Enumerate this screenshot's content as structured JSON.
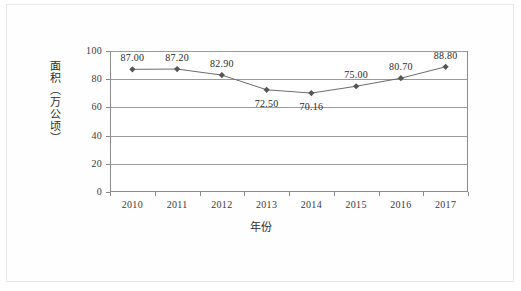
{
  "chart_data": {
    "type": "line",
    "title": "",
    "subtitle": "",
    "xlabel": "年份",
    "ylabel": "面积（万公顷）",
    "categories": [
      "2010",
      "2011",
      "2012",
      "2013",
      "2014",
      "2015",
      "2016",
      "2017"
    ],
    "values": [
      87.0,
      87.2,
      82.9,
      72.5,
      70.16,
      75.0,
      80.7,
      88.8
    ],
    "data_labels": [
      "87.00",
      "87.20",
      "82.90",
      "72.50",
      "70.16",
      "75.00",
      "80.70",
      "88.80"
    ],
    "label_positions": [
      "above",
      "above",
      "above",
      "below",
      "below",
      "above",
      "above",
      "above"
    ],
    "ylim": [
      0,
      100
    ],
    "y_ticks": [
      "0",
      "20",
      "40",
      "60",
      "80",
      "100"
    ],
    "y_tick_values": [
      0,
      20,
      40,
      60,
      80,
      100
    ],
    "grid": true,
    "grid_axis": "y",
    "legend": "none",
    "series": [
      {
        "name": "面积",
        "values": [
          87.0,
          87.2,
          82.9,
          72.5,
          70.16,
          75.0,
          80.7,
          88.8
        ],
        "marker": "diamond",
        "line_color": "#6b6b6b",
        "marker_color": "#555555"
      }
    ],
    "colors": {
      "line": "#6b6b6b",
      "marker": "#555555",
      "grid": "#9a9a9a",
      "axis": "#8b8b8b",
      "text": "#2b2b2b",
      "background": "#ffffff",
      "page_border": "#e7e7e7"
    }
  }
}
